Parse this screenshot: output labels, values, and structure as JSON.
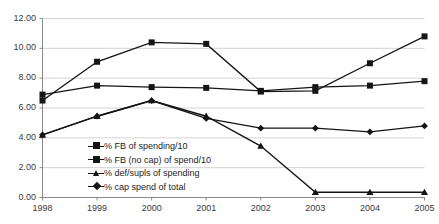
{
  "chart_data": {
    "type": "line",
    "title": "",
    "xlabel": "",
    "ylabel": "",
    "x": [
      "1998",
      "1999",
      "2000",
      "2001",
      "2002",
      "2003",
      "2004",
      "2005"
    ],
    "categories": [
      "1998",
      "1999",
      "2000",
      "2001",
      "2002",
      "2003",
      "2004",
      "2005"
    ],
    "ylim": [
      0.0,
      12.0
    ],
    "ytick_step": 2.0,
    "ytick_labels": [
      "0.00",
      "2.00",
      "4.00",
      "6.00",
      "8.00",
      "10.00",
      "12.00"
    ],
    "ytick_values": [
      0.0,
      2.0,
      4.0,
      6.0,
      8.0,
      10.0,
      12.0
    ],
    "xtick_labels": [
      "1998",
      "1999",
      "2000",
      "2001",
      "2002",
      "2003",
      "2004",
      "2005"
    ],
    "grid": "horizontal",
    "legend_position": "inside-lower-left",
    "series": [
      {
        "name": "% FB of spending/10",
        "marker": "square",
        "color": "#151515",
        "values": [
          6.9,
          7.5,
          7.4,
          7.35,
          7.15,
          7.4,
          7.5,
          7.8
        ]
      },
      {
        "name": "% FB (no cap) of spend/10",
        "marker": "square",
        "color": "#151515",
        "values": [
          6.5,
          9.1,
          10.4,
          10.3,
          7.1,
          7.15,
          9.0,
          10.8
        ]
      },
      {
        "name": "% def/supls of spending",
        "marker": "triangle",
        "color": "#151515",
        "values": [
          4.2,
          5.45,
          6.5,
          5.45,
          3.45,
          0.35,
          0.35,
          0.35
        ]
      },
      {
        "name": "% cap spend of total",
        "marker": "diamond",
        "color": "#151515",
        "values": [
          4.2,
          5.45,
          6.5,
          5.3,
          4.65,
          4.65,
          4.4,
          4.8
        ]
      }
    ]
  },
  "legend": {
    "items": [
      {
        "label": "% FB of spending/10"
      },
      {
        "label": "% FB (no cap) of spend/10"
      },
      {
        "label": "% def/supls of spending"
      },
      {
        "label": "% cap spend of total"
      }
    ]
  },
  "axes": {
    "y_labels": [
      "12.00",
      "10.00",
      "8.00",
      "6.00",
      "4.00",
      "2.00",
      "0.00"
    ],
    "x_labels": [
      "1998",
      "1999",
      "2000",
      "2001",
      "2002",
      "2003",
      "2004",
      "2005"
    ]
  },
  "colors": {
    "ink": "#151515",
    "grid": "#d4d4d4",
    "axis": "#8a8a8a",
    "text": "#2b2b2b",
    "background": "#ffffff"
  }
}
